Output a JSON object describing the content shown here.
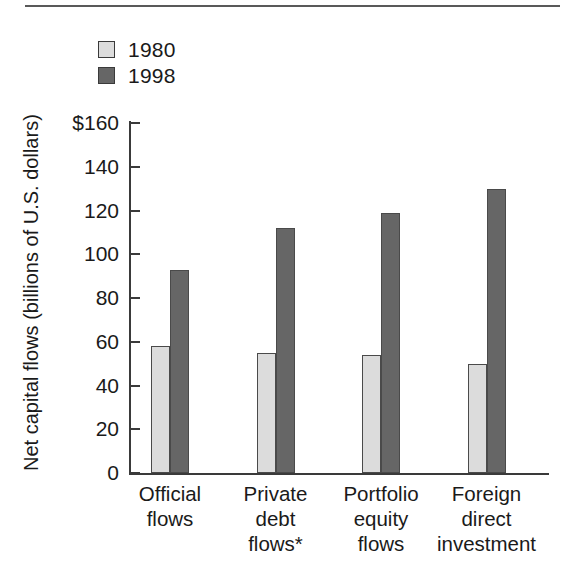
{
  "chart_data": {
    "type": "bar",
    "title": "",
    "subtitle": "",
    "xlabel": "",
    "ylabel": "Net capital flows (billions of U.S. dollars)",
    "categories": [
      "Official\nflows",
      "Private\ndebt\nflows*",
      "Portfolio\nequity\nflows",
      "Foreign\ndirect\ninvestment"
    ],
    "series": [
      {
        "name": "1980",
        "color": "#dcdcdc",
        "values": [
          58,
          55,
          54,
          50
        ]
      },
      {
        "name": "1998",
        "color": "#666666",
        "values": [
          93,
          112,
          119,
          130
        ]
      }
    ],
    "ylim": [
      0,
      160
    ],
    "ytick_values": [
      160,
      140,
      120,
      100,
      80,
      60,
      40,
      20,
      0
    ],
    "ytick_labels": [
      "$160",
      "140",
      "120",
      "100",
      "80",
      "60",
      "40",
      "20",
      "0"
    ],
    "grid": false,
    "legend_position": "top-left",
    "footnote": "*"
  },
  "legend": {
    "entries": [
      {
        "label": "1980",
        "color": "#dcdcdc"
      },
      {
        "label": "1998",
        "color": "#666666"
      }
    ]
  },
  "colors": {
    "series_1980": "#dcdcdc",
    "series_1998": "#666666",
    "axis": "#3a3a3a",
    "rule": "#595959",
    "text": "#1a1a1a",
    "background": "#ffffff"
  }
}
